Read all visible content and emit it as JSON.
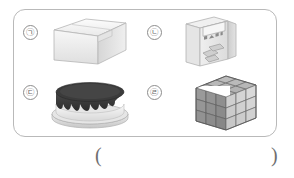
{
  "question": {
    "frame_label": "choice-box",
    "answer_blank": {
      "open_paren": "(",
      "close_paren": ")"
    }
  },
  "colors": {
    "frame_border": "#b9b9b9",
    "marker_border": "#8d8d8d",
    "text": "#6a6a6a",
    "box_light": "#f2f2f2",
    "box_mid": "#e0e0e0",
    "box_dark": "#cfcfcf",
    "cake_dark": "#3a3a3a",
    "cake_cream": "#ededed",
    "cube_dark": "#8f8f8f",
    "cube_mid": "#a8a8a8",
    "cube_light": "#d2d2d2"
  },
  "items": [
    {
      "marker": "㉠",
      "marker_letter": "ㄱ",
      "name": "cardboard-box",
      "caption": "상자"
    },
    {
      "marker": "㉡",
      "marker_letter": "ㄴ",
      "name": "tissue-box",
      "caption": "휴지 상자",
      "package_text": "미소 수"
    },
    {
      "marker": "㉢",
      "marker_letter": "ㄷ",
      "name": "chocolate-cake",
      "caption": "케이크"
    },
    {
      "marker": "㉣",
      "marker_letter": "ㄹ",
      "name": "rubiks-cube",
      "caption": "큐브"
    }
  ]
}
